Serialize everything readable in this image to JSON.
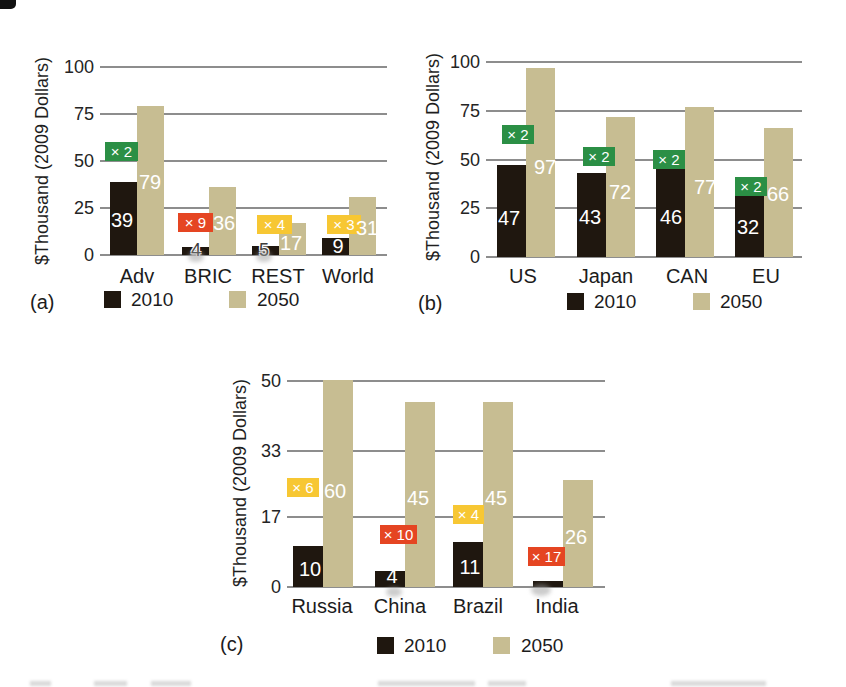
{
  "colors": {
    "bar_2010": "#1f170f",
    "bar_2050": "#c7bd92",
    "grid": "#8d8d8d",
    "text": "#1c1c1c",
    "value_text": "#ffffff",
    "badge_green": "#2b8f45",
    "badge_red": "#e54522",
    "badge_yellow": "#f7c733",
    "badge_text": "#ffffff",
    "background": "#ffffff"
  },
  "legend": {
    "items": [
      {
        "label": "2010",
        "swatch": "bar_2010"
      },
      {
        "label": "2050",
        "swatch": "bar_2050"
      }
    ]
  },
  "chart_data": [
    {
      "id": "a",
      "type": "bar",
      "panel_label": "(a)",
      "title": "",
      "xlabel": "",
      "ylabel": "$Thousand (2009 Dollars)",
      "ylim": [
        0,
        100
      ],
      "yticks": [
        0,
        25,
        50,
        75,
        100
      ],
      "grid": true,
      "legend_position": "bottom",
      "categories": [
        "Adv",
        "BRIC",
        "REST",
        "World"
      ],
      "series": [
        {
          "name": "2010",
          "values": [
            39,
            4,
            5,
            9
          ],
          "labels": [
            "39",
            "4",
            "5",
            "9"
          ]
        },
        {
          "name": "2050",
          "values": [
            79,
            36,
            17,
            31
          ],
          "labels": [
            "79",
            "36",
            "17",
            "31"
          ]
        }
      ],
      "growth_multipliers": [
        {
          "category": "Adv",
          "label": "× 2",
          "color": "green"
        },
        {
          "category": "BRIC",
          "label": "× 9",
          "color": "red"
        },
        {
          "category": "REST",
          "label": "× 4",
          "color": "yellow"
        },
        {
          "category": "World",
          "label": "× 3",
          "color": "yellow"
        }
      ]
    },
    {
      "id": "b",
      "type": "bar",
      "panel_label": "(b)",
      "title": "",
      "xlabel": "",
      "ylabel": "$Thousand (2009 Dollars)",
      "ylim": [
        0,
        100
      ],
      "yticks": [
        0,
        25,
        50,
        75,
        100
      ],
      "grid": true,
      "legend_position": "bottom",
      "categories": [
        "US",
        "Japan",
        "CAN",
        "EU"
      ],
      "series": [
        {
          "name": "2010",
          "values": [
            47,
            43,
            46,
            32
          ],
          "labels": [
            "47",
            "43",
            "46",
            "32"
          ]
        },
        {
          "name": "2050",
          "values": [
            97,
            72,
            77,
            66
          ],
          "labels": [
            "97",
            "72",
            "77",
            "66"
          ]
        }
      ],
      "growth_multipliers": [
        {
          "category": "US",
          "label": "× 2",
          "color": "green"
        },
        {
          "category": "Japan",
          "label": "× 2",
          "color": "green"
        },
        {
          "category": "CAN",
          "label": "× 2",
          "color": "green"
        },
        {
          "category": "EU",
          "label": "× 2",
          "color": "green"
        }
      ]
    },
    {
      "id": "c",
      "type": "bar",
      "panel_label": "(c)",
      "title": "",
      "xlabel": "",
      "ylabel": "$Thousand (2009 Dollars)",
      "ylim": [
        0,
        50
      ],
      "yticks": [
        0,
        17,
        33,
        50
      ],
      "grid": true,
      "legend_position": "bottom",
      "categories": [
        "Russia",
        "China",
        "Brazil",
        "India"
      ],
      "series": [
        {
          "name": "2010",
          "values": [
            10,
            4,
            11,
            1.5
          ],
          "labels": [
            "10",
            "4",
            "11",
            ""
          ]
        },
        {
          "name": "2050",
          "values": [
            60,
            45,
            45,
            26
          ],
          "labels": [
            "60",
            "45",
            "45",
            "26"
          ]
        }
      ],
      "growth_multipliers": [
        {
          "category": "Russia",
          "label": "× 6",
          "color": "yellow"
        },
        {
          "category": "China",
          "label": "× 10",
          "color": "red"
        },
        {
          "category": "Brazil",
          "label": "× 4",
          "color": "yellow"
        },
        {
          "category": "India",
          "label": "× 17",
          "color": "red"
        }
      ],
      "bars_clipped_at_plot_top": [
        "Russia 2050 (60)"
      ]
    }
  ]
}
